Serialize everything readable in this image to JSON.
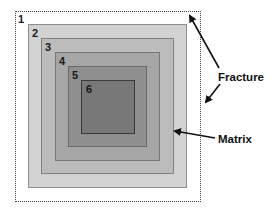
{
  "diagram": {
    "type": "nested-squares",
    "outer_boundary": {
      "label": "1",
      "style": "dotted",
      "x": 15,
      "y": 11,
      "w": 186,
      "h": 191
    },
    "squares": [
      {
        "label": "2",
        "x": 28,
        "y": 24,
        "w": 159,
        "h": 164,
        "color": "#d2d2d2"
      },
      {
        "label": "3",
        "x": 41,
        "y": 38,
        "w": 133,
        "h": 136,
        "color": "#bcbcbc"
      },
      {
        "label": "4",
        "x": 55,
        "y": 52,
        "w": 105,
        "h": 109,
        "color": "#a6a6a6"
      },
      {
        "label": "5",
        "x": 68,
        "y": 66,
        "w": 79,
        "h": 81,
        "color": "#8f8f8f"
      },
      {
        "label": "6",
        "x": 81,
        "y": 80,
        "w": 54,
        "h": 54,
        "color": "#787878"
      }
    ],
    "annotations": [
      {
        "text": "Fracture",
        "x": 218,
        "y": 72
      },
      {
        "text": "Matrix",
        "x": 218,
        "y": 134
      }
    ]
  }
}
